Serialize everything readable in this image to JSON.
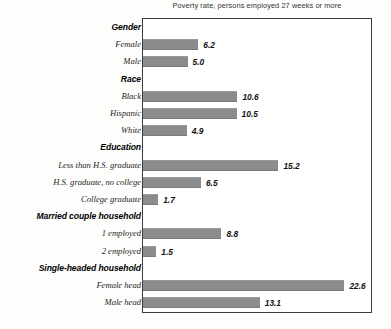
{
  "chart_data": {
    "type": "bar",
    "orientation": "horizontal",
    "title": "Poverty rate, persons employed 27 weeks or more",
    "xlabel": "",
    "ylabel": "",
    "xlim": [
      0,
      25.7
    ],
    "grid": false,
    "legend": null,
    "bar_color": "#8c8c8c",
    "frame_color": "#3d3d3d",
    "value_label_format": "one-decimal",
    "groups": [
      {
        "heading": "Gender",
        "rows": [
          {
            "label": "Female",
            "value": 6.2,
            "value_text": "6.2"
          },
          {
            "label": "Male",
            "value": 5.0,
            "value_text": "5.0"
          }
        ]
      },
      {
        "heading": "Race",
        "rows": [
          {
            "label": "Black",
            "value": 10.6,
            "value_text": "10.6"
          },
          {
            "label": "Hispanic",
            "value": 10.5,
            "value_text": "10.5"
          },
          {
            "label": "White",
            "value": 4.9,
            "value_text": "4.9"
          }
        ]
      },
      {
        "heading": "Education",
        "rows": [
          {
            "label": "Less than H.S. graduate",
            "value": 15.2,
            "value_text": "15.2"
          },
          {
            "label": "H.S. graduate, no college",
            "value": 6.5,
            "value_text": "6.5"
          },
          {
            "label": "College graduate",
            "value": 1.7,
            "value_text": "1.7"
          }
        ]
      },
      {
        "heading": "Married couple household",
        "rows": [
          {
            "label": "1 employed",
            "value": 8.8,
            "value_text": "8.8"
          },
          {
            "label": "2 employed",
            "value": 1.5,
            "value_text": "1.5"
          }
        ]
      },
      {
        "heading": "Single-headed household",
        "rows": [
          {
            "label": "Female head",
            "value": 22.6,
            "value_text": "22.6"
          },
          {
            "label": "Male head",
            "value": 13.1,
            "value_text": "13.1"
          }
        ]
      }
    ]
  }
}
